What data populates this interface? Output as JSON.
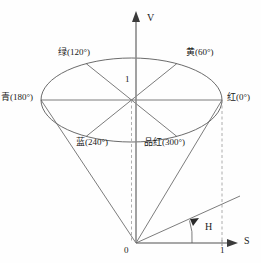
{
  "figure": {
    "background_color": "#fefefe",
    "line_color": "#555555",
    "axis_color": "#808080",
    "text_color": "#1a1a1a"
  },
  "axes": {
    "vertical": {
      "label": "V",
      "name": "value-axis"
    },
    "horizontal": {
      "label": "S",
      "name": "saturation-axis"
    },
    "angle": {
      "label": "H",
      "name": "hue-angle"
    },
    "origin_label": "0",
    "s_tick_label": "1",
    "v_radius_label": "1"
  },
  "hues": [
    {
      "id": "red",
      "label": "红(0°)",
      "degrees": 0
    },
    {
      "id": "yellow",
      "label": "黄(60°)",
      "degrees": 60
    },
    {
      "id": "green",
      "label": "绿(120°)",
      "degrees": 120
    },
    {
      "id": "cyan",
      "label": "青(180°)",
      "degrees": 180
    },
    {
      "id": "blue",
      "label": "蓝(240°)",
      "degrees": 240
    },
    {
      "id": "magenta",
      "label": "品红(300°)",
      "degrees": 300
    }
  ]
}
